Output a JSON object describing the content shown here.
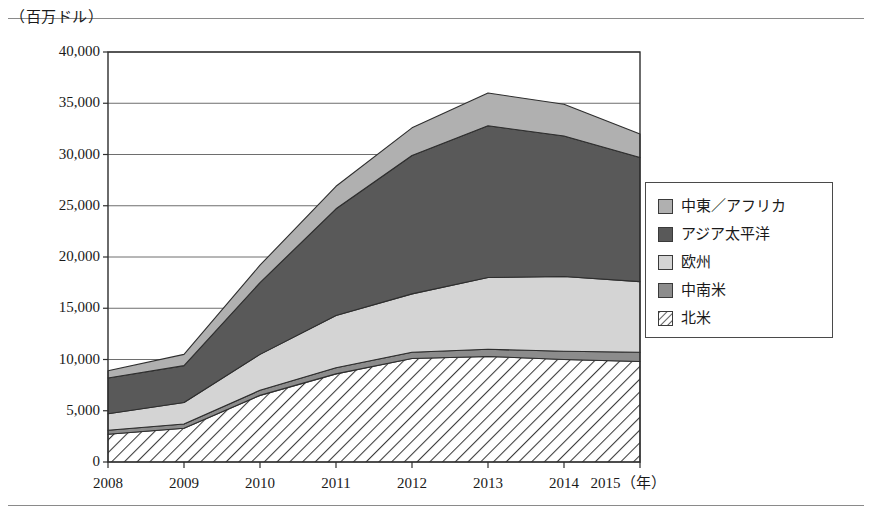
{
  "chart_data": {
    "type": "area",
    "stacked": true,
    "title": "",
    "subtitle": "",
    "unit_label": "（百万ドル）",
    "xlabel": "（年）",
    "ylabel": "",
    "grid": true,
    "legend_position": "right",
    "x": [
      2008,
      2009,
      2010,
      2011,
      2012,
      2013,
      2014,
      2015
    ],
    "categories": [
      "2008",
      "2009",
      "2010",
      "2011",
      "2012",
      "2013",
      "2014",
      "2015"
    ],
    "xtick_labels": [
      "2008",
      "2009",
      "2010",
      "2011",
      "2012",
      "2013",
      "2014",
      "2015（年）"
    ],
    "ytick_labels": [
      "0",
      "5,000",
      "10,000",
      "15,000",
      "20,000",
      "25,000",
      "30,000",
      "35,000",
      "40,000"
    ],
    "ytick_values": [
      0,
      5000,
      10000,
      15000,
      20000,
      25000,
      30000,
      35000,
      40000
    ],
    "ylim": [
      0,
      40000
    ],
    "xlim": [
      2008,
      2015
    ],
    "series": [
      {
        "name": "北米",
        "order": 1,
        "fill": "#ffffff",
        "pattern": "diagonal-hatch",
        "values": [
          2700,
          3300,
          6500,
          8600,
          10100,
          10300,
          10000,
          9800
        ]
      },
      {
        "name": "中南米",
        "order": 2,
        "fill": "#8c8c8c",
        "pattern": "solid",
        "values": [
          400,
          400,
          500,
          600,
          600,
          700,
          800,
          900
        ]
      },
      {
        "name": "欧州",
        "order": 3,
        "fill": "#d4d4d4",
        "pattern": "solid",
        "values": [
          1600,
          2100,
          3500,
          5100,
          5700,
          7000,
          7300,
          6900
        ]
      },
      {
        "name": "アジア太平洋",
        "order": 4,
        "fill": "#595959",
        "pattern": "solid",
        "values": [
          3500,
          3600,
          7000,
          10400,
          13500,
          14800,
          13700,
          12100
        ]
      },
      {
        "name": "中東／アフリカ",
        "order": 5,
        "fill": "#b0b0b0",
        "pattern": "solid",
        "values": [
          700,
          1100,
          1700,
          2200,
          2700,
          3200,
          3100,
          2300
        ]
      }
    ],
    "totals": [
      8900,
      10500,
      19200,
      26900,
      32600,
      36000,
      34900,
      32000
    ],
    "cumulative": {
      "北米": [
        2700,
        3300,
        6500,
        8600,
        10100,
        10300,
        10000,
        9800
      ],
      "中南米": [
        3100,
        3700,
        7000,
        9200,
        10700,
        11000,
        10800,
        10700
      ],
      "欧州": [
        4700,
        5800,
        10500,
        14300,
        16400,
        18000,
        18100,
        17600
      ],
      "アジア太平洋": [
        8200,
        9400,
        17500,
        24700,
        29900,
        32800,
        31800,
        29700
      ],
      "中東／アフリカ": [
        8900,
        10500,
        19200,
        26900,
        32600,
        36000,
        34900,
        32000
      ]
    }
  },
  "legend": {
    "items": [
      {
        "label": "中東／アフリカ",
        "swatch": "mid-light-gray"
      },
      {
        "label": "アジア太平洋",
        "swatch": "dark-gray"
      },
      {
        "label": "欧州",
        "swatch": "light-gray"
      },
      {
        "label": "中南米",
        "swatch": "medium-gray"
      },
      {
        "label": "北米",
        "swatch": "white-hatch"
      }
    ]
  }
}
